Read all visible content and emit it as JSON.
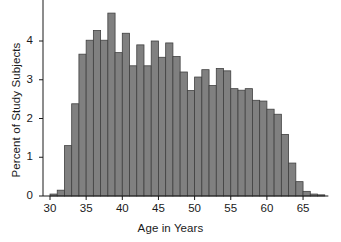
{
  "chart_data": {
    "type": "bar",
    "title": "",
    "subtitle": "",
    "xlabel": "Age in Years",
    "ylabel": "Percent of Study Subjects",
    "xlim": [
      29.0,
      68.5
    ],
    "ylim": [
      0,
      4.9
    ],
    "xticks": [
      30,
      35,
      40,
      45,
      50,
      55,
      60,
      65
    ],
    "yticks": [
      0,
      1,
      2,
      3,
      4
    ],
    "xtick_labels": [
      "30",
      "35",
      "40",
      "45",
      "50",
      "55",
      "60",
      "65"
    ],
    "ytick_labels": [
      "0",
      "1",
      "2",
      "3",
      "4"
    ],
    "grid": false,
    "legend": null,
    "bin_width": 1,
    "bar_color": "#808080",
    "bar_edge_color": "#404040",
    "axis_color": "#1a1a1a",
    "categories": [
      "30",
      "31",
      "32",
      "33",
      "34",
      "35",
      "36",
      "37",
      "38",
      "39",
      "40",
      "41",
      "42",
      "43",
      "44",
      "45",
      "46",
      "47",
      "48",
      "49",
      "50",
      "51",
      "52",
      "53",
      "54",
      "55",
      "56",
      "57",
      "58",
      "59",
      "60",
      "61",
      "62",
      "63",
      "64",
      "65",
      "66",
      "67"
    ],
    "values": [
      0.05,
      0.15,
      1.3,
      2.38,
      3.66,
      4.02,
      4.27,
      4.02,
      4.72,
      3.7,
      4.2,
      3.36,
      3.9,
      3.36,
      4.0,
      3.58,
      3.95,
      3.6,
      3.2,
      2.72,
      3.07,
      3.26,
      2.85,
      3.29,
      3.23,
      2.77,
      2.73,
      2.77,
      2.47,
      2.45,
      2.24,
      2.11,
      1.59,
      0.85,
      0.37,
      0.12,
      0.05,
      0.03
    ],
    "bin_left_edges": [
      30,
      31,
      32,
      33,
      34,
      35,
      36,
      37,
      38,
      39,
      40,
      41,
      42,
      43,
      44,
      45,
      46,
      47,
      48,
      49,
      50,
      51,
      52,
      53,
      54,
      55,
      56,
      57,
      58,
      59,
      60,
      61,
      62,
      63,
      64,
      65,
      66,
      67
    ]
  }
}
